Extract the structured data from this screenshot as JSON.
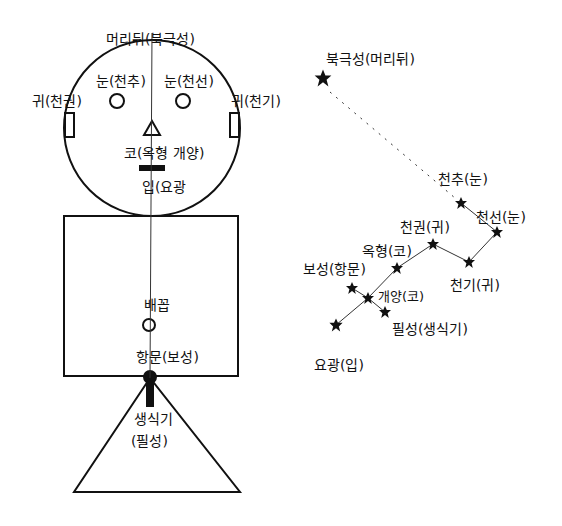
{
  "figure": {
    "title_label": "머리뒤(북극성)",
    "left_eye_label": "눈(천추)",
    "right_eye_label": "눈(천선)",
    "left_ear_label": "귀(천권)",
    "right_ear_label": "귀(천기)",
    "nose_label": "코(옥형 개양)",
    "mouth_label": "입(요광",
    "navel_label": "배꼽",
    "anus_label": "항문(보성)",
    "genital_label_line1": "생식기",
    "genital_label_line2": "(필성)"
  },
  "constellation": {
    "stars": [
      {
        "id": "polaris",
        "label": "북극성(머리뒤)",
        "x": 323,
        "y": 78
      },
      {
        "id": "cheonchu",
        "label": "천추(눈)",
        "x": 461,
        "y": 203
      },
      {
        "id": "cheonseon",
        "label": "천선(눈)",
        "x": 497,
        "y": 232
      },
      {
        "id": "cheongwon",
        "label": "천권(귀)",
        "x": 433,
        "y": 244
      },
      {
        "id": "cheongi",
        "label": "천기(귀)",
        "x": 469,
        "y": 262
      },
      {
        "id": "okhyeong",
        "label": "옥형(코)",
        "x": 397,
        "y": 268
      },
      {
        "id": "bosung",
        "label": "보성(항문)",
        "x": 352,
        "y": 288
      },
      {
        "id": "gaeyang",
        "label": "개양(코)",
        "x": 368,
        "y": 298
      },
      {
        "id": "pilseong",
        "label": "필성(생식기)",
        "x": 385,
        "y": 312
      },
      {
        "id": "yogwang",
        "label": "요광(입)",
        "x": 336,
        "y": 325
      }
    ],
    "labels": {
      "polaris": "북극성(머리뒤)",
      "cheonchu": "천추(눈)",
      "cheonseon": "천선(눈)",
      "cheongwon": "천권(귀)",
      "cheongi": "천기(귀)",
      "okhyeong": "옥형(코)",
      "bosung": "보성(항문)",
      "gaeyang": "개양(코)",
      "pilseong": "필성(생식기)",
      "yogwang": "요광(입)"
    }
  },
  "colors": {
    "ink": "#111111",
    "background": "#ffffff"
  }
}
